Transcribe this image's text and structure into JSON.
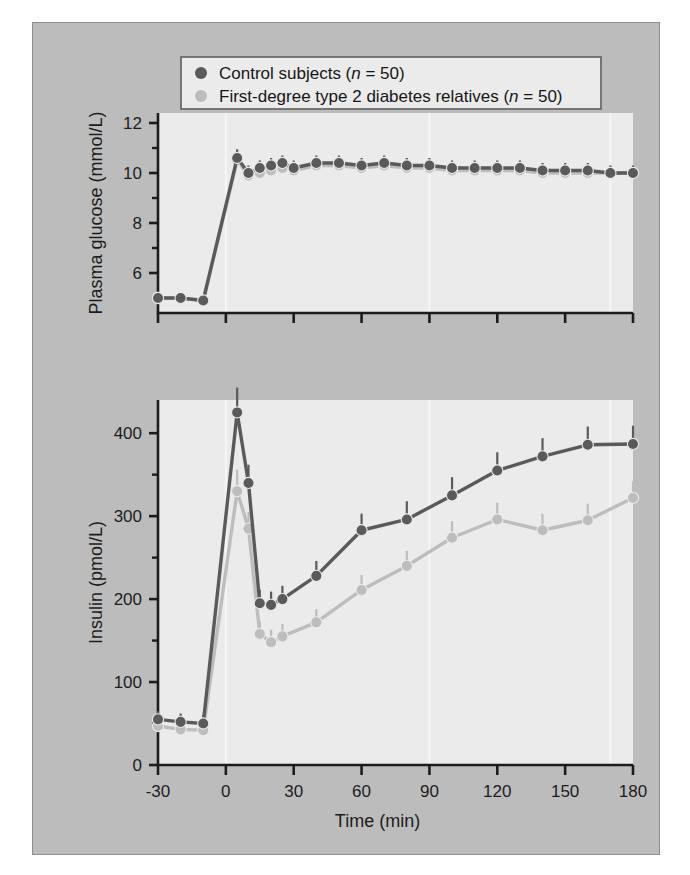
{
  "figure": {
    "background_color": "#bcbcbc",
    "plot_background_color": "#ebebeb",
    "axis_color": "#1c1c1c",
    "page_background_color": "#ffffff"
  },
  "legend": {
    "position": "top-center",
    "background_color": "#ebebeb",
    "border_color": "#6b6b6b",
    "entries": [
      {
        "marker": "filled-circle-dark",
        "color": "#5a5a5a",
        "label_prefix": "Control subjects (",
        "label_italic": "n",
        "label_suffix": " = 50)",
        "label": "Control subjects (n = 50)"
      },
      {
        "marker": "filled-circle-light",
        "color": "#bdbdbd",
        "label_prefix": "First-degree type 2 diabetes relatives (",
        "label_italic": "n",
        "label_suffix": " = 50)",
        "label": "First-degree type 2 diabetes relatives (n = 50)"
      }
    ]
  },
  "chart_data": [
    {
      "id": "glucose-panel",
      "type": "line",
      "title": "",
      "xlabel": "",
      "ylabel": "Plasma glucose (mmol/L)",
      "xlim": [
        -30,
        180
      ],
      "ylim": [
        4.4,
        12.4
      ],
      "yticks": [
        6,
        8,
        10,
        12
      ],
      "yticklabels": [
        "6",
        "8",
        "10",
        "12"
      ],
      "yminorticks": [
        5,
        7,
        9,
        11
      ],
      "xticks": [
        -30,
        0,
        30,
        60,
        90,
        120,
        150,
        180
      ],
      "grid": false,
      "legend_position": "top",
      "error_bars": true,
      "series": [
        {
          "name": "Control subjects (n = 50)",
          "color": "#5a5a5a",
          "x": [
            -30,
            -20,
            -10,
            5,
            10,
            15,
            20,
            25,
            30,
            40,
            50,
            60,
            70,
            80,
            90,
            100,
            110,
            120,
            130,
            140,
            150,
            160,
            170,
            180
          ],
          "values": [
            5.0,
            5.0,
            4.9,
            10.6,
            10.0,
            10.2,
            10.3,
            10.4,
            10.2,
            10.4,
            10.4,
            10.3,
            10.4,
            10.3,
            10.3,
            10.2,
            10.2,
            10.2,
            10.2,
            10.1,
            10.1,
            10.1,
            10.0,
            10.0
          ],
          "errors": [
            0.15,
            0.15,
            0.15,
            0.35,
            0.3,
            0.3,
            0.3,
            0.3,
            0.3,
            0.3,
            0.3,
            0.3,
            0.3,
            0.3,
            0.3,
            0.3,
            0.3,
            0.3,
            0.3,
            0.3,
            0.3,
            0.3,
            0.3,
            0.3
          ]
        },
        {
          "name": "First-degree type 2 diabetes relatives (n = 50)",
          "color": "#bdbdbd",
          "x": [
            -30,
            -20,
            -10,
            5,
            10,
            15,
            20,
            25,
            30,
            40,
            50,
            60,
            70,
            80,
            90,
            100,
            110,
            120,
            130,
            140,
            150,
            160,
            170,
            180
          ],
          "values": [
            5.0,
            5.0,
            4.9,
            10.5,
            9.9,
            10.0,
            10.1,
            10.2,
            10.1,
            10.3,
            10.3,
            10.2,
            10.3,
            10.2,
            10.2,
            10.1,
            10.1,
            10.1,
            10.1,
            10.0,
            10.0,
            10.0,
            10.0,
            10.0
          ],
          "errors": [
            0.15,
            0.15,
            0.15,
            0.35,
            0.3,
            0.3,
            0.3,
            0.3,
            0.3,
            0.3,
            0.3,
            0.3,
            0.3,
            0.3,
            0.3,
            0.3,
            0.3,
            0.3,
            0.3,
            0.3,
            0.3,
            0.3,
            0.3,
            0.3
          ]
        }
      ]
    },
    {
      "id": "insulin-panel",
      "type": "line",
      "title": "",
      "xlabel": "Time (min)",
      "ylabel": "Insulin (pmol/L)",
      "xlim": [
        -30,
        180
      ],
      "ylim": [
        0,
        440
      ],
      "yticks": [
        0,
        100,
        200,
        300,
        400
      ],
      "yticklabels": [
        "0",
        "100",
        "200",
        "300",
        "400"
      ],
      "yminorticks": [
        50,
        150,
        250,
        350
      ],
      "xticks": [
        -30,
        0,
        30,
        60,
        90,
        120,
        150,
        180
      ],
      "xticklabels": [
        "-30",
        "0",
        "30",
        "60",
        "90",
        "120",
        "150",
        "180"
      ],
      "grid": false,
      "error_bars": true,
      "series": [
        {
          "name": "Control subjects (n = 50)",
          "color": "#5a5a5a",
          "x": [
            -30,
            -20,
            -10,
            5,
            10,
            15,
            20,
            25,
            40,
            60,
            80,
            100,
            120,
            140,
            160,
            180
          ],
          "values": [
            55,
            52,
            50,
            425,
            340,
            195,
            193,
            200,
            228,
            283,
            296,
            325,
            355,
            372,
            386,
            387
          ],
          "errors": [
            10,
            10,
            10,
            30,
            22,
            16,
            16,
            16,
            18,
            20,
            22,
            22,
            22,
            22,
            22,
            22
          ]
        },
        {
          "name": "First-degree type 2 diabetes relatives (n = 50)",
          "color": "#bdbdbd",
          "x": [
            -30,
            -20,
            -10,
            5,
            10,
            15,
            20,
            25,
            40,
            60,
            80,
            100,
            120,
            140,
            160,
            180
          ],
          "values": [
            47,
            43,
            42,
            330,
            285,
            158,
            148,
            155,
            172,
            211,
            240,
            274,
            296,
            283,
            295,
            322
          ],
          "errors": [
            9,
            9,
            9,
            26,
            20,
            15,
            15,
            15,
            16,
            18,
            18,
            20,
            20,
            20,
            20,
            20
          ]
        }
      ]
    }
  ]
}
